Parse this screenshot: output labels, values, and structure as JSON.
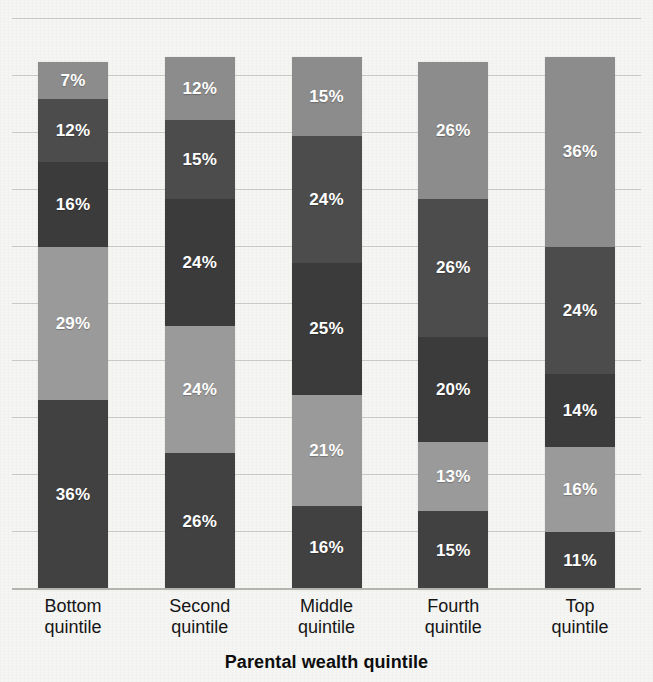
{
  "chart_data": {
    "type": "bar",
    "subtype": "stacked-100-percent",
    "title": "",
    "xlabel": "Parental wealth quintile",
    "ylabel": "",
    "ylim": [
      0,
      100
    ],
    "grid": true,
    "gridline_count": 11,
    "legend_position": "none",
    "orientation": "vertical",
    "stack_order": "top-to-bottom",
    "value_suffix": "%",
    "categories": [
      "Bottom quintile",
      "Second quintile",
      "Middle quintile",
      "Fourth quintile",
      "Top quintile"
    ],
    "series": [
      {
        "name": "Segment 1 (top)",
        "color": "#8c8c8c",
        "values": [
          7,
          12,
          15,
          26,
          36
        ]
      },
      {
        "name": "Segment 2",
        "color": "#4c4c4c",
        "values": [
          12,
          15,
          24,
          26,
          24
        ]
      },
      {
        "name": "Segment 3",
        "color": "#3b3b3b",
        "values": [
          16,
          24,
          25,
          20,
          14
        ]
      },
      {
        "name": "Segment 4",
        "color": "#9a9a9a",
        "values": [
          29,
          24,
          21,
          13,
          16
        ]
      },
      {
        "name": "Segment 5 (bottom)",
        "color": "#414141",
        "values": [
          36,
          26,
          16,
          15,
          11
        ]
      }
    ],
    "bars": [
      {
        "category_line1": "Bottom",
        "category_line2": "quintile",
        "total": 100,
        "segments": [
          {
            "label": "7%",
            "value": 7,
            "color": "#8c8c8c"
          },
          {
            "label": "12%",
            "value": 12,
            "color": "#4c4c4c"
          },
          {
            "label": "16%",
            "value": 16,
            "color": "#3b3b3b"
          },
          {
            "label": "29%",
            "value": 29,
            "color": "#9a9a9a"
          },
          {
            "label": "36%",
            "value": 36,
            "color": "#414141"
          }
        ]
      },
      {
        "category_line1": "Second",
        "category_line2": "quintile",
        "total": 101,
        "segments": [
          {
            "label": "12%",
            "value": 12,
            "color": "#8c8c8c"
          },
          {
            "label": "15%",
            "value": 15,
            "color": "#4c4c4c"
          },
          {
            "label": "24%",
            "value": 24,
            "color": "#3b3b3b"
          },
          {
            "label": "24%",
            "value": 24,
            "color": "#9a9a9a"
          },
          {
            "label": "26%",
            "value": 26,
            "color": "#414141"
          }
        ]
      },
      {
        "category_line1": "Middle",
        "category_line2": "quintile",
        "total": 101,
        "segments": [
          {
            "label": "15%",
            "value": 15,
            "color": "#8c8c8c"
          },
          {
            "label": "24%",
            "value": 24,
            "color": "#4c4c4c"
          },
          {
            "label": "25%",
            "value": 25,
            "color": "#3b3b3b"
          },
          {
            "label": "21%",
            "value": 21,
            "color": "#9a9a9a"
          },
          {
            "label": "16%",
            "value": 16,
            "color": "#414141"
          }
        ]
      },
      {
        "category_line1": "Fourth",
        "category_line2": "quintile",
        "total": 100,
        "segments": [
          {
            "label": "26%",
            "value": 26,
            "color": "#8c8c8c"
          },
          {
            "label": "26%",
            "value": 26,
            "color": "#4c4c4c"
          },
          {
            "label": "20%",
            "value": 20,
            "color": "#3b3b3b"
          },
          {
            "label": "13%",
            "value": 13,
            "color": "#9a9a9a"
          },
          {
            "label": "15%",
            "value": 15,
            "color": "#414141"
          }
        ]
      },
      {
        "category_line1": "Top",
        "category_line2": "quintile",
        "total": 101,
        "segments": [
          {
            "label": "36%",
            "value": 36,
            "color": "#8c8c8c"
          },
          {
            "label": "24%",
            "value": 24,
            "color": "#4c4c4c"
          },
          {
            "label": "14%",
            "value": 14,
            "color": "#3b3b3b"
          },
          {
            "label": "16%",
            "value": 16,
            "color": "#9a9a9a"
          },
          {
            "label": "11%",
            "value": 11,
            "color": "#414141"
          }
        ]
      }
    ]
  },
  "axis": {
    "x_title": "Parental wealth quintile"
  },
  "colors": {
    "background": "#f5f5f3",
    "gridline": "#c9c9c4",
    "baseline": "#b4b4ae",
    "label_text": "#ffffff",
    "category_text": "#161616",
    "axis_title_text": "#0d0d0d"
  }
}
